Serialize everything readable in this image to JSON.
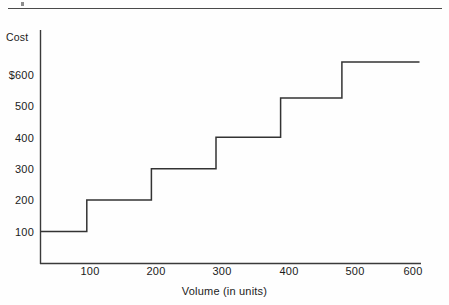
{
  "figure": {
    "top_rule": "horizontal-rule",
    "speck": "scan-artifact"
  },
  "chart_data": {
    "type": "line",
    "subtype": "step",
    "title": "",
    "xlabel": "Volume (in units)",
    "ylabel": "Cost",
    "xlim": [
      0,
      630
    ],
    "ylim": [
      0,
      760
    ],
    "grid": false,
    "legend": false,
    "x_ticks": [
      100,
      200,
      300,
      400,
      500,
      600
    ],
    "x_tick_labels": [
      "100",
      "200",
      "300",
      "400",
      "500",
      "600"
    ],
    "y_ticks": [
      100,
      200,
      300,
      400,
      500,
      600
    ],
    "y_tick_labels": [
      "100",
      "200",
      "300",
      "400",
      "500",
      "$600"
    ],
    "series": [
      {
        "name": "Step cost",
        "step_mode": "post",
        "color": "#333333",
        "segments": [
          {
            "x_start": 0,
            "x_end": 95,
            "y": 100
          },
          {
            "x_start": 95,
            "x_end": 195,
            "y": 200
          },
          {
            "x_start": 195,
            "x_end": 295,
            "y": 300
          },
          {
            "x_start": 295,
            "x_end": 395,
            "y": 400
          },
          {
            "x_start": 395,
            "x_end": 490,
            "y": 525
          },
          {
            "x_start": 490,
            "x_end": 610,
            "y": 640
          }
        ]
      }
    ]
  },
  "axis": {
    "y_title": "Cost",
    "x_title": "Volume (in units)",
    "y_labels": [
      "$600",
      "500",
      "400",
      "300",
      "200",
      "100"
    ],
    "x_labels": [
      "100",
      "200",
      "300",
      "400",
      "500",
      "600"
    ]
  }
}
